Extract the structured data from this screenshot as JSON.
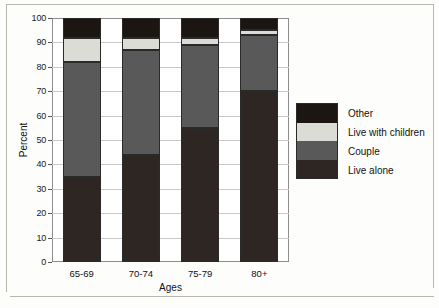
{
  "chart_data": {
    "type": "bar",
    "subtype": "stacked-100",
    "title": "",
    "xlabel": "Ages",
    "ylabel": "Percent",
    "categories": [
      "65-69",
      "70-74",
      "75-79",
      "80+"
    ],
    "ylim": [
      0,
      100
    ],
    "yticks": [
      0,
      10,
      20,
      30,
      40,
      50,
      60,
      70,
      80,
      90,
      100
    ],
    "grid": true,
    "legend_position": "right",
    "series": [
      {
        "name": "Live alone",
        "color": "#2e2623",
        "values": [
          35,
          44,
          55,
          70
        ]
      },
      {
        "name": "Couple",
        "color": "#595959",
        "values": [
          47,
          43,
          34,
          23
        ]
      },
      {
        "name": "Live with children",
        "color": "#dcdcd7",
        "values": [
          10,
          5,
          3,
          2
        ]
      },
      {
        "name": "Other",
        "color": "#1c1612",
        "values": [
          8,
          8,
          8,
          5
        ]
      }
    ],
    "cumulative_tops": {
      "live_alone": [
        35,
        44,
        55,
        70
      ],
      "couple": [
        82,
        87,
        89,
        93
      ],
      "live_with_children": [
        92,
        92,
        92,
        95
      ],
      "other": [
        100,
        100,
        100,
        100
      ]
    },
    "legend_entries": [
      {
        "label": "Other",
        "color": "#1c1612"
      },
      {
        "label": "Live with children",
        "color": "#dcdcd7"
      },
      {
        "label": "Couple",
        "color": "#595959"
      },
      {
        "label": "Live alone",
        "color": "#2e2623"
      }
    ]
  }
}
